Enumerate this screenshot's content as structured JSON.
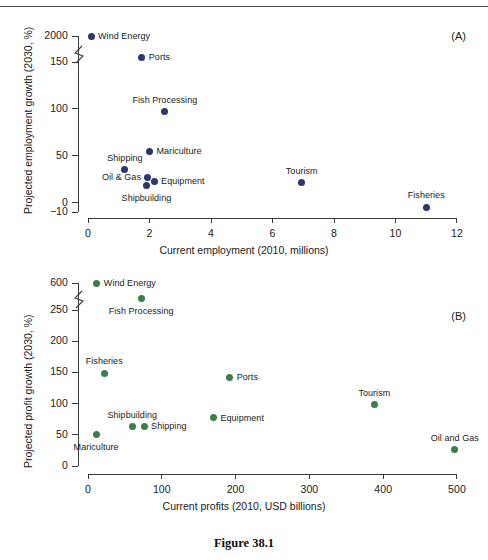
{
  "figure": {
    "caption": "Figure 38.1",
    "panel_a_tag": "(A)",
    "panel_b_tag": "(B)"
  },
  "colors": {
    "panel_a_marker": "#2d3670",
    "panel_b_marker": "#3d7d4a",
    "axis": "#3a3a3a",
    "text": "#1a1a1a"
  },
  "chart_data": [
    {
      "type": "scatter",
      "panel": "(A)",
      "title": "",
      "xlabel": "Current employment (2010, millions)",
      "ylabel": "Projected employment growth (2030, %)",
      "xlim": [
        0,
        12
      ],
      "ylim": [
        -10,
        2000
      ],
      "grid": false,
      "legend": "none",
      "y_axis_break": true,
      "y_break_note": "Axis broken between 150 and 2000",
      "xticks": [
        "0",
        "2",
        "4",
        "6",
        "8",
        "10",
        "12"
      ],
      "xtick_values": [
        0,
        2,
        4,
        6,
        8,
        10,
        12
      ],
      "yticks": [
        "2000",
        "150",
        "100",
        "50",
        "0",
        "-10"
      ],
      "ytick_values": [
        2000,
        150,
        100,
        50,
        0,
        -10
      ],
      "marker_color": "#2d3670",
      "points": [
        {
          "label": "Wind Energy",
          "x": 0.1,
          "y": 2000,
          "label_pos": "right"
        },
        {
          "label": "Ports",
          "x": 1.75,
          "y": 155,
          "label_pos": "right"
        },
        {
          "label": "Fish Processing",
          "x": 2.5,
          "y": 97,
          "label_pos": "above"
        },
        {
          "label": "Mariculture",
          "x": 2.0,
          "y": 55,
          "label_pos": "right"
        },
        {
          "label": "Shipping",
          "x": 1.2,
          "y": 35,
          "label_pos": "above"
        },
        {
          "label": "Oil & Gas",
          "x": 1.95,
          "y": 27,
          "label_pos": "left"
        },
        {
          "label": "Equipment",
          "x": 2.15,
          "y": 23,
          "label_pos": "right"
        },
        {
          "label": "Shipbuilding",
          "x": 1.9,
          "y": 18,
          "label_pos": "below"
        },
        {
          "label": "Tourism",
          "x": 6.95,
          "y": 21,
          "label_pos": "above"
        },
        {
          "label": "Fisheries",
          "x": 11.0,
          "y": -5,
          "label_pos": "above"
        }
      ]
    },
    {
      "type": "scatter",
      "panel": "(B)",
      "title": "",
      "xlabel": "Current profits (2010, USD billions)",
      "ylabel": "Projected profit growth (2030, %)",
      "xlim": [
        0,
        500
      ],
      "ylim": [
        0,
        600
      ],
      "grid": false,
      "legend": "none",
      "y_axis_break": true,
      "y_break_note": "Axis broken between 250 and 600",
      "xticks": [
        "0",
        "100",
        "200",
        "300",
        "400",
        "500"
      ],
      "xtick_values": [
        0,
        100,
        200,
        300,
        400,
        500
      ],
      "yticks": [
        "600",
        "250",
        "200",
        "150",
        "100",
        "50",
        "0"
      ],
      "ytick_values": [
        600,
        250,
        200,
        150,
        100,
        50,
        0
      ],
      "marker_color": "#3d7d4a",
      "points": [
        {
          "label": "Wind Energy",
          "x": 12,
          "y": 600,
          "label_pos": "right"
        },
        {
          "label": "Fish Processing",
          "x": 72,
          "y": 268,
          "label_pos": "below"
        },
        {
          "label": "Fisheries",
          "x": 22,
          "y": 149,
          "label_pos": "above"
        },
        {
          "label": "Ports",
          "x": 192,
          "y": 142,
          "label_pos": "right"
        },
        {
          "label": "Tourism",
          "x": 388,
          "y": 98,
          "label_pos": "above"
        },
        {
          "label": "Equipment",
          "x": 170,
          "y": 77,
          "label_pos": "right"
        },
        {
          "label": "Shipping",
          "x": 76,
          "y": 64,
          "label_pos": "right"
        },
        {
          "label": "Shipbuilding",
          "x": 60,
          "y": 63,
          "label_pos": "above"
        },
        {
          "label": "Mariculture",
          "x": 11,
          "y": 50,
          "label_pos": "below"
        },
        {
          "label": "Oil and Gas",
          "x": 497,
          "y": 26,
          "label_pos": "above"
        }
      ]
    }
  ]
}
